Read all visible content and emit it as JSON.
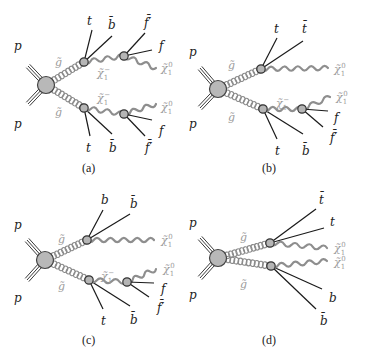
{
  "figure": {
    "panels": [
      {
        "id": "a",
        "caption": "(a)",
        "main_vertex": {
          "incoming": [
            "p",
            "p"
          ]
        },
        "gluinos": [
          {
            "label": "g̃",
            "decay_products": [
              "t",
              "b̄"
            ],
            "chargino": {
              "label": "χ̃₁⁻",
              "decay_products": [
                "f̄′",
                "f"
              ],
              "neutralino": "χ̃₁⁰"
            }
          },
          {
            "label": "g̃",
            "decay_products": [
              "t",
              "b̄"
            ],
            "chargino": {
              "label": "χ̃₁⁻",
              "decay_products": [
                "f",
                "f̄′"
              ],
              "neutralino": "χ̃₁⁰"
            }
          }
        ]
      },
      {
        "id": "b",
        "caption": "(b)",
        "main_vertex": {
          "incoming": [
            "p",
            "p"
          ]
        },
        "gluinos": [
          {
            "label": "g̃",
            "decay_products": [
              "t",
              "t̄"
            ],
            "neutralino": "χ̃₁⁰"
          },
          {
            "label": "g̃",
            "decay_products": [
              "t",
              "b̄"
            ],
            "chargino": {
              "label": "χ̃₁⁻",
              "decay_products": [
                "f",
                "f̄′"
              ],
              "neutralino": "χ̃₁⁰"
            }
          }
        ]
      },
      {
        "id": "c",
        "caption": "(c)",
        "main_vertex": {
          "incoming": [
            "p",
            "p"
          ]
        },
        "gluinos": [
          {
            "label": "g̃",
            "decay_products": [
              "b",
              "b̄"
            ],
            "neutralino": "χ̃₁⁰"
          },
          {
            "label": "g̃",
            "decay_products": [
              "t",
              "b̄"
            ],
            "chargino": {
              "label": "χ̃₁⁻",
              "decay_products": [
                "f",
                "f̄′"
              ],
              "neutralino": "χ̃₁⁰"
            }
          }
        ]
      },
      {
        "id": "d",
        "caption": "(d)",
        "main_vertex": {
          "incoming": [
            "p",
            "p"
          ]
        },
        "gluinos": [
          {
            "label": "g̃",
            "decay_products": [
              "t̄",
              "t"
            ],
            "neutralino": "χ̃₁⁰"
          },
          {
            "label": "g̃",
            "decay_products": [
              "b",
              "b̄"
            ],
            "neutralino": "χ̃₁⁰"
          }
        ]
      }
    ]
  },
  "colors": {
    "sparticle_line": "#8e8e8e",
    "fermion_line": "#1a1a1a",
    "vertex_fill": "#b5b5b5",
    "sparticle_label": "#9a9a9a"
  }
}
